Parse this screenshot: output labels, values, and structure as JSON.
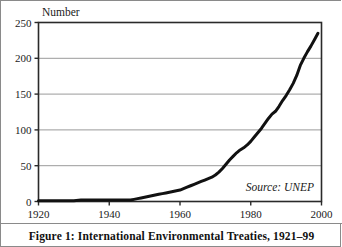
{
  "figure": {
    "caption": "Figure 1: International Environmental Treaties, 1921–99",
    "source_note": "Source: UNEP",
    "frame_color": "#8a8a8a",
    "background_color": "#ffffff"
  },
  "chart_data": {
    "type": "line",
    "title": "",
    "xlabel": "",
    "ylabel": "Number",
    "xlim": [
      1920,
      2000
    ],
    "ylim": [
      0,
      250
    ],
    "xticks": [
      1920,
      1940,
      1960,
      1980,
      2000
    ],
    "yticks": [
      0,
      50,
      100,
      150,
      200,
      250
    ],
    "xtick_labels": [
      "1920",
      "1940",
      "1960",
      "1980",
      "2000"
    ],
    "ytick_labels": [
      "0",
      "50",
      "100",
      "150",
      "200",
      "250"
    ],
    "grid": "horizontal",
    "grid_color": "#9a9a9a",
    "line_color": "#111111",
    "line_width": 3,
    "legend": "none",
    "annotations": [
      {
        "text": "Source: UNEP",
        "x": 1993,
        "y": 22,
        "style": "italic",
        "align": "right"
      }
    ],
    "x": [
      1920,
      1922,
      1924,
      1926,
      1928,
      1930,
      1932,
      1934,
      1936,
      1938,
      1940,
      1942,
      1944,
      1946,
      1947,
      1948,
      1949,
      1950,
      1951,
      1952,
      1953,
      1954,
      1955,
      1956,
      1957,
      1958,
      1959,
      1960,
      1961,
      1962,
      1963,
      1964,
      1965,
      1966,
      1967,
      1968,
      1969,
      1970,
      1971,
      1972,
      1973,
      1974,
      1975,
      1976,
      1977,
      1978,
      1979,
      1980,
      1981,
      1982,
      1983,
      1984,
      1985,
      1986,
      1987,
      1988,
      1989,
      1990,
      1991,
      1992,
      1993,
      1994,
      1995,
      1996,
      1997,
      1998,
      1999
    ],
    "values": [
      1,
      1,
      1,
      1,
      1,
      1,
      2,
      2,
      2,
      2,
      2,
      2,
      2,
      2,
      3,
      4,
      5,
      6,
      7,
      8,
      9,
      10,
      11,
      12,
      13,
      14,
      15,
      16,
      18,
      20,
      22,
      24,
      26,
      28,
      30,
      32,
      34,
      37,
      41,
      46,
      52,
      58,
      63,
      68,
      72,
      75,
      79,
      84,
      90,
      96,
      102,
      109,
      116,
      122,
      126,
      133,
      141,
      148,
      156,
      165,
      176,
      190,
      200,
      209,
      217,
      226,
      235
    ],
    "series_name": "International environmental treaties"
  }
}
